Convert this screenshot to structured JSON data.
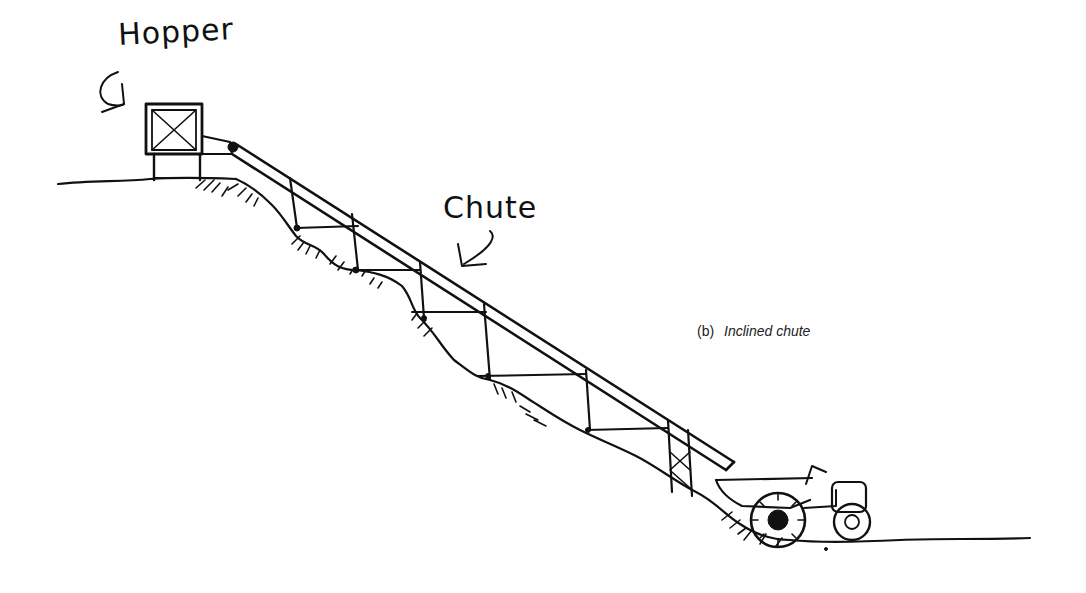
{
  "figure": {
    "labels": {
      "hopper": "Hopper",
      "chute": "Chute"
    },
    "caption": {
      "id": "(b)",
      "text": "Inclined chute"
    },
    "elements": [
      "hopper",
      "chute",
      "trestle-supports",
      "hillside-slope",
      "tractor-trailer"
    ],
    "colors": {
      "ink": "#111111",
      "background": "#ffffff"
    }
  }
}
